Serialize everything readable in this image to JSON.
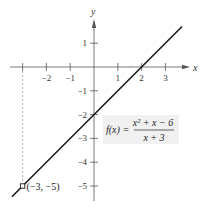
{
  "chart_data": {
    "type": "line",
    "title": "",
    "xlabel": "x",
    "ylabel": "y",
    "xlim": [
      -3.5,
      3.7
    ],
    "ylim": [
      -5.5,
      2.0
    ],
    "grid": false,
    "x_ticks": [
      -3,
      -2,
      -1,
      1,
      2,
      3
    ],
    "x_tick_labels": [
      "",
      "-2",
      "-1",
      "1",
      "2",
      "3"
    ],
    "y_ticks": [
      1,
      -1,
      -2,
      -3,
      -4,
      -5
    ],
    "y_tick_labels": [
      "1",
      "-1",
      "-2",
      "-3",
      "-4",
      "-5"
    ],
    "series": [
      {
        "name": "f(x) = (x^2 + x - 6)/(x + 3)",
        "equation": "y = x - 2, x ≠ -3",
        "x": [
          -3.45,
          3.7
        ],
        "y": [
          -5.45,
          1.7
        ]
      }
    ],
    "hole": {
      "x": -3,
      "y": -5,
      "label": "(−3, −5)"
    },
    "dashed_guide": {
      "x": -3,
      "from_y": 0,
      "to_y": -5
    },
    "annotation": {
      "lhs": "f(x) = ",
      "numerator": "x² + x − 6",
      "denominator": "x + 3",
      "background": "#f1f1f1"
    },
    "colors": {
      "line": "#1a1a1a",
      "axis": "#555555",
      "dash": "#999999"
    }
  }
}
